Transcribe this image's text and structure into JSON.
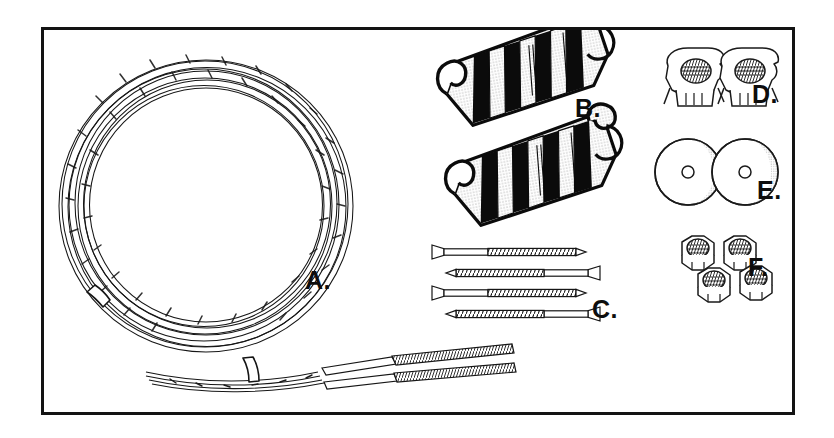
{
  "figure": {
    "kind": "exploded-parts-diagram",
    "title_visible": false,
    "background_color": "#ffffff",
    "border_color": "#131313",
    "border_width_px": 3,
    "frame": {
      "x": 41,
      "y": 27,
      "width": 754,
      "height": 388
    }
  },
  "labels": {
    "a": "A.",
    "b": "B.",
    "c": "C.",
    "d": "D.",
    "e": "E.",
    "f": "F."
  },
  "parts": [
    {
      "key": "a",
      "label": "A.",
      "name": "coiled-steel-cable",
      "description": "Large coil of braided steel aircraft cable with two white binding straps and two threaded stud ends",
      "quantity": 1,
      "features": {
        "binding_straps": 2,
        "threaded_ends": 2,
        "strand_lines": 9
      },
      "render": {
        "center_x": 205,
        "center_y": 205,
        "radius_outer": 148,
        "radius_inner": 118
      }
    },
    {
      "key": "b",
      "label": "B.",
      "name": "cable-clamp-bracket",
      "description": "Ribbed cable clamp guide with hooked ends, bold black bands and stippled faces",
      "quantity": 2,
      "features": {
        "ribs": 4,
        "hooks": 2
      }
    },
    {
      "key": "c",
      "label": "C.",
      "name": "flat-head-wood-screw",
      "description": "Flat countersunk head wood screws with coarse threads, drawn alternating left/right",
      "quantity": 4
    },
    {
      "key": "d",
      "label": "D.",
      "name": "tee-nut-anchor",
      "description": "Threaded tee-nut anchor plate with prongs and internal thread",
      "quantity": 2
    },
    {
      "key": "e",
      "label": "E.",
      "name": "flat-washer",
      "description": "Round flat washer with small center bore, stippled shading",
      "quantity": 2
    },
    {
      "key": "f",
      "label": "F.",
      "name": "hex-nut",
      "description": "Hexagonal nut with internal thread, arranged two over two",
      "quantity": 4
    }
  ],
  "colors": {
    "line": "#111111",
    "fill_white": "#ffffff",
    "stipple": "#b9b9b9",
    "black_band": "#0b0b0b"
  }
}
